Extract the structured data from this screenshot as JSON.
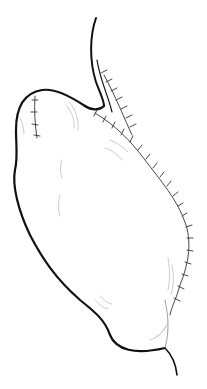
{
  "figure": {
    "subject": "stomach illustration with surgical staple lines",
    "colors": {
      "background": "#ffffff",
      "outline": "#111111",
      "staple": "#333333",
      "shading": "#b5b5b5"
    },
    "parts": {
      "esophagus": "esophagus",
      "stomach_body": "stomach",
      "duodenum": "duodenum",
      "main_staple_line": "staple line (long)",
      "fundus_staple_line": "staple line (short)"
    }
  }
}
